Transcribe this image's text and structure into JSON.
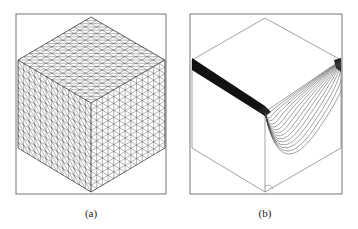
{
  "figure": {
    "panels": [
      {
        "id": "a",
        "caption": "(a)",
        "description": "Triangulated surface mesh of a cube (isometric view)"
      },
      {
        "id": "b",
        "caption": "(b)",
        "description": "Cube with contour lines concentrated near one front edge and on right face"
      }
    ],
    "colors": {
      "line": "#333333",
      "frame": "#555555",
      "background": "#ffffff"
    }
  }
}
